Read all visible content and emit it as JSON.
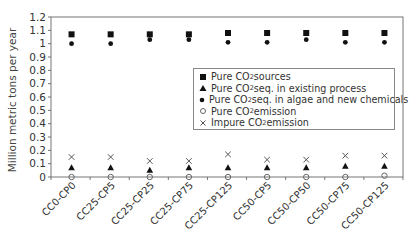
{
  "chart_data": {
    "type": "scatter",
    "title": "",
    "xlabel": "",
    "ylabel": "Million metric tons per year",
    "ylim": [
      0,
      1.2
    ],
    "yticks": [
      "0",
      "0.1",
      "0.2",
      "0.3",
      "0.4",
      "0.5",
      "0.6",
      "0.7",
      "0.8",
      "0.9",
      "1",
      "1.1",
      "1.2"
    ],
    "grid": false,
    "legend_position": "inside-right",
    "categories": [
      "CC0-CP0",
      "CC25-CP5",
      "CC25-CP25",
      "CC25-CP75",
      "CC25-CP125",
      "CC50-CP5",
      "CC50-CP50",
      "CC50-CP75",
      "CC50-CP125"
    ],
    "series": [
      {
        "name": "Pure CO2 sources",
        "name_prefix": "Pure CO",
        "name_sub": "2",
        "name_suffix": " sources",
        "marker": "square",
        "values": [
          1.07,
          1.07,
          1.07,
          1.07,
          1.08,
          1.08,
          1.08,
          1.08,
          1.08
        ]
      },
      {
        "name": "Pure CO2 seq. in existing process",
        "name_prefix": "Pure CO",
        "name_sub": "2",
        "name_suffix": " seq. in existing process",
        "marker": "triangle",
        "values": [
          0.07,
          0.07,
          0.05,
          0.07,
          0.07,
          0.07,
          0.07,
          0.08,
          0.08
        ]
      },
      {
        "name": "Pure CO2 seq. in algae and new chemicals",
        "name_prefix": "Pure CO",
        "name_sub": "2",
        "name_suffix": " seq. in algae and new chemicals",
        "marker": "dot",
        "values": [
          1.0,
          1.0,
          1.03,
          1.03,
          1.01,
          1.01,
          1.03,
          1.01,
          1.01
        ]
      },
      {
        "name": "Pure CO2 emission",
        "name_prefix": "Pure CO",
        "name_sub": "2",
        "name_suffix": " emission",
        "marker": "circle-open",
        "values": [
          0.0,
          0.0,
          0.0,
          0.0,
          0.0,
          0.0,
          0.0,
          0.0,
          0.01
        ]
      },
      {
        "name": "Impure CO2 emission",
        "name_prefix": "Impure CO",
        "name_sub": "2",
        "name_suffix": " emission",
        "marker": "x",
        "values": [
          0.15,
          0.15,
          0.12,
          0.12,
          0.17,
          0.13,
          0.13,
          0.16,
          0.16
        ]
      }
    ]
  },
  "colors": {
    "marker": "#111111",
    "open_marker": "#666666",
    "x_marker": "#555555",
    "axis": "#666666",
    "text": "#333333"
  }
}
